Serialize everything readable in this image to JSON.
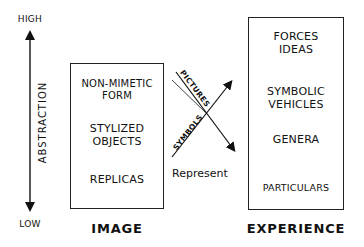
{
  "axis": {
    "high_label": "HIGH",
    "low_label": "LOW",
    "axis_label": "ABSTRACTION"
  },
  "image_box": {
    "title": "IMAGE",
    "items": [
      "NON-MIMETIC\nFORM",
      "STYLIZED\nOBJECTS",
      "REPLICAS"
    ],
    "item_lines": [
      [
        "NON-MIMETIC",
        "FORM"
      ],
      [
        "STYLIZED",
        "OBJECTS"
      ],
      [
        "REPLICAS"
      ]
    ]
  },
  "experience_box": {
    "title": "EXPERIENCE",
    "item_lines": [
      [
        "FORCES",
        "IDEAS"
      ],
      [
        "SYMBOLIC",
        "VEHICLES"
      ],
      [
        "GENERA"
      ],
      [
        "PARTICULARS"
      ]
    ]
  },
  "arrows": {
    "pictures_label": "PICTURES",
    "symbols_label": "SYMBOLS",
    "relation_label": "Represent"
  }
}
